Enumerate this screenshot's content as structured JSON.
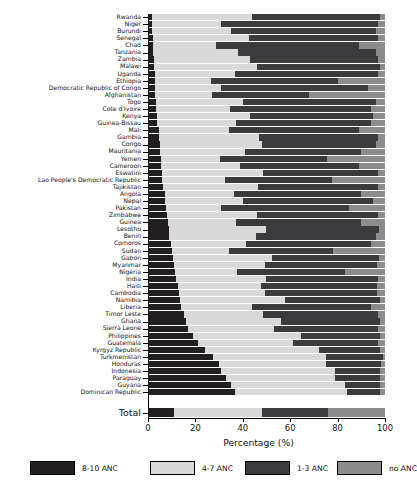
{
  "chart_data": {
    "type": "bar",
    "orientation": "horizontal",
    "stacked": true,
    "title": "",
    "xlabel": "Percentage (%)",
    "ylabel": "",
    "xlim": [
      0,
      100
    ],
    "xticks": [
      0,
      20,
      40,
      60,
      80,
      100
    ],
    "grid": false,
    "legend_position": "bottom",
    "series": [
      {
        "name": "8-10 ANC",
        "color": "#231f20"
      },
      {
        "name": "4-7 ANC",
        "color": "#d9d9d9"
      },
      {
        "name": "1-3 ANC",
        "color": "#3b3b3d"
      },
      {
        "name": "no ANC",
        "color": "#8c8c8c"
      }
    ],
    "categories": [
      "Rwanda",
      "Niger",
      "Burundi",
      "Senegal",
      "Chad",
      "Tanzania",
      "Zambia",
      "Malawi",
      "Uganda",
      "Ethiopia",
      "Democratic Republic of Congo",
      "Afghanistan",
      "Togo",
      "Cote d'Ivoire",
      "Kenya",
      "Guinea-Bissau",
      "Mali",
      "Gambia",
      "Congo",
      "Mauritania",
      "Yemen",
      "Cameroon",
      "Eswatini",
      "Lao People's Democratic Republic",
      "Tajikistan",
      "Angola",
      "Nepal",
      "Pakistan",
      "Zimbabwe",
      "Guinea",
      "Lesotho",
      "Benin",
      "Comoros",
      "Sudan",
      "Gabon",
      "Myanmar",
      "Nigeria",
      "India",
      "Haiti",
      "Cambodia",
      "Namibia",
      "Liberia",
      "Timor Leste",
      "Ghana",
      "Sierra Leone",
      "Philippines",
      "Guatemala",
      "Kyrgyz Republic",
      "Turkmenistan",
      "Honduras",
      "Indonesia",
      "Paraguay",
      "Guyana",
      "Dominican Republic"
    ],
    "total_category": "Total",
    "values": [
      [
        1.5,
        42.5,
        54.0,
        2.0
      ],
      [
        1.5,
        29.5,
        66.0,
        3.0
      ],
      [
        1.5,
        33.5,
        61.0,
        4.0
      ],
      [
        2.0,
        40.5,
        54.5,
        3.0
      ],
      [
        2.0,
        26.5,
        60.5,
        11.0
      ],
      [
        2.0,
        36.0,
        58.0,
        4.0
      ],
      [
        2.5,
        40.5,
        54.0,
        3.0
      ],
      [
        2.5,
        43.5,
        52.0,
        2.0
      ],
      [
        3.0,
        33.5,
        60.5,
        3.0
      ],
      [
        3.0,
        23.5,
        53.5,
        20.0
      ],
      [
        3.0,
        28.0,
        62.0,
        7.0
      ],
      [
        3.0,
        24.0,
        41.0,
        32.0
      ],
      [
        3.5,
        36.5,
        56.0,
        4.0
      ],
      [
        3.5,
        31.0,
        59.5,
        6.0
      ],
      [
        4.0,
        39.0,
        52.0,
        5.0
      ],
      [
        4.0,
        33.0,
        57.0,
        6.0
      ],
      [
        4.5,
        29.5,
        55.0,
        11.0
      ],
      [
        4.5,
        42.5,
        50.0,
        3.0
      ],
      [
        5.0,
        43.0,
        48.0,
        4.0
      ],
      [
        5.0,
        36.0,
        49.0,
        10.0
      ],
      [
        5.5,
        25.0,
        45.0,
        24.5
      ],
      [
        5.5,
        33.5,
        50.0,
        11.0
      ],
      [
        6.0,
        42.5,
        48.5,
        3.0
      ],
      [
        6.0,
        26.5,
        45.0,
        22.5
      ],
      [
        6.5,
        40.0,
        50.5,
        3.0
      ],
      [
        7.0,
        29.5,
        53.5,
        10.0
      ],
      [
        7.0,
        33.0,
        55.0,
        5.0
      ],
      [
        7.5,
        23.5,
        54.0,
        15.0
      ],
      [
        8.0,
        38.0,
        51.0,
        3.0
      ],
      [
        8.5,
        28.5,
        53.0,
        10.0
      ],
      [
        9.0,
        41.0,
        47.5,
        2.5
      ],
      [
        9.0,
        36.5,
        50.5,
        4.0
      ],
      [
        9.5,
        32.0,
        52.5,
        6.0
      ],
      [
        10.0,
        24.0,
        44.0,
        22.0
      ],
      [
        10.5,
        42.0,
        45.0,
        2.5
      ],
      [
        11.0,
        38.5,
        47.0,
        3.5
      ],
      [
        11.5,
        26.0,
        45.5,
        17.0
      ],
      [
        12.0,
        38.0,
        47.0,
        3.0
      ],
      [
        12.5,
        35.0,
        49.0,
        3.5
      ],
      [
        13.0,
        36.5,
        47.0,
        3.5
      ],
      [
        13.5,
        44.5,
        40.0,
        2.0
      ],
      [
        14.0,
        30.0,
        50.0,
        6.0
      ],
      [
        15.0,
        33.5,
        48.5,
        3.0
      ],
      [
        16.0,
        40.0,
        42.0,
        2.0
      ],
      [
        17.0,
        36.0,
        44.0,
        3.0
      ],
      [
        19.0,
        45.5,
        33.5,
        2.0
      ],
      [
        21.0,
        40.0,
        36.0,
        3.0
      ],
      [
        24.0,
        48.0,
        26.0,
        2.0
      ],
      [
        27.5,
        47.5,
        24.0,
        1.0
      ],
      [
        30.0,
        45.0,
        23.5,
        1.5
      ],
      [
        31.0,
        48.0,
        19.0,
        2.0
      ],
      [
        33.0,
        46.0,
        19.0,
        2.0
      ],
      [
        35.0,
        48.0,
        15.0,
        2.0
      ],
      [
        36.5,
        47.5,
        14.0,
        2.0
      ]
    ],
    "total_values": [
      11.0,
      37.0,
      28.0,
      24.0
    ]
  },
  "axis": {
    "x_tick_labels": [
      "0",
      "20",
      "40",
      "60",
      "80",
      "100"
    ],
    "x_title": "Percentage (%)"
  },
  "legend": {
    "items": [
      {
        "label": "8-10 ANC",
        "color": "#231f20"
      },
      {
        "label": "4-7 ANC",
        "color": "#d9d9d9"
      },
      {
        "label": "1-3 ANC",
        "color": "#3b3b3d"
      },
      {
        "label": "no ANC",
        "color": "#8c8c8c"
      }
    ]
  }
}
